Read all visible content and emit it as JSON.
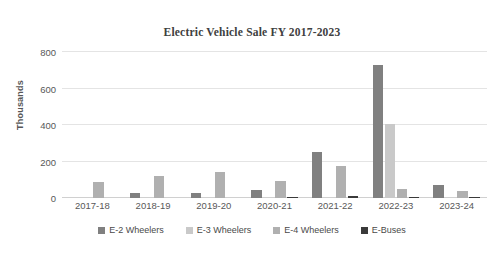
{
  "chart_data": {
    "type": "bar",
    "title": "Electric Vehicle Sale FY 2017-2023",
    "xlabel": "",
    "ylabel": "Thousands",
    "ylim": [
      0,
      800
    ],
    "yticks": [
      0,
      200,
      400,
      600,
      800
    ],
    "grid": "horizontal",
    "legend_position": "bottom",
    "categories": [
      "2017-18",
      "2018-19",
      "2019-20",
      "2020-21",
      "2021-22",
      "2022-23",
      "2023-24"
    ],
    "series": [
      {
        "name": "E-2 Wheelers",
        "color": "#808080",
        "values": [
          0,
          27,
          25,
          45,
          253,
          730,
          70
        ]
      },
      {
        "name": "E-3 Wheelers",
        "color": "#c9c9c9",
        "values": [
          0,
          0,
          0,
          0,
          0,
          408,
          0
        ]
      },
      {
        "name": "E-4 Wheelers",
        "color": "#b0b0b0",
        "values": [
          88,
          118,
          145,
          92,
          178,
          50,
          38
        ]
      },
      {
        "name": "E-Buses",
        "color": "#3a3a3a",
        "values": [
          0,
          0,
          0,
          2,
          9,
          8,
          3
        ]
      }
    ]
  },
  "axis": {
    "y_title": "Thousands"
  }
}
